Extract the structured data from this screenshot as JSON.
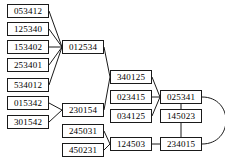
{
  "graph": {
    "type": "node-link-diagram",
    "width": 225,
    "height": 162,
    "background_color": "#ffffff",
    "node_border_color": "#1a1a1a",
    "node_fill_color": "#ffffff",
    "edge_color": "#1a1a1a",
    "nodes": [
      {
        "id": "n0",
        "label": "053412",
        "x": 7,
        "y": 4,
        "w": 42
      },
      {
        "id": "n1",
        "label": "125340",
        "x": 7,
        "y": 22,
        "w": 42
      },
      {
        "id": "n2",
        "label": "153402",
        "x": 7,
        "y": 40,
        "w": 42
      },
      {
        "id": "n3",
        "label": "253401",
        "x": 7,
        "y": 58,
        "w": 42
      },
      {
        "id": "n4",
        "label": "534012",
        "x": 7,
        "y": 78,
        "w": 42
      },
      {
        "id": "n5",
        "label": "015342",
        "x": 7,
        "y": 96,
        "w": 42
      },
      {
        "id": "n6",
        "label": "301542",
        "x": 7,
        "y": 115,
        "w": 42
      },
      {
        "id": "n7",
        "label": "012534",
        "x": 62,
        "y": 40,
        "w": 42
      },
      {
        "id": "n8",
        "label": "230154",
        "x": 62,
        "y": 103,
        "w": 42
      },
      {
        "id": "n9",
        "label": "245031",
        "x": 62,
        "y": 124,
        "w": 42
      },
      {
        "id": "n10",
        "label": "450231",
        "x": 62,
        "y": 143,
        "w": 42
      },
      {
        "id": "n11",
        "label": "340125",
        "x": 110,
        "y": 70,
        "w": 42
      },
      {
        "id": "n12",
        "label": "023415",
        "x": 110,
        "y": 90,
        "w": 42
      },
      {
        "id": "n13",
        "label": "034125",
        "x": 110,
        "y": 109,
        "w": 42
      },
      {
        "id": "n14",
        "label": "124503",
        "x": 110,
        "y": 137,
        "w": 42
      },
      {
        "id": "n15",
        "label": "025341",
        "x": 160,
        "y": 90,
        "w": 42
      },
      {
        "id": "n16",
        "label": "145023",
        "x": 160,
        "y": 109,
        "w": 42
      },
      {
        "id": "n17",
        "label": "234015",
        "x": 160,
        "y": 137,
        "w": 42
      }
    ],
    "edges": [
      {
        "from": "n0",
        "to": "n7",
        "shape": "line"
      },
      {
        "from": "n1",
        "to": "n7",
        "shape": "line"
      },
      {
        "from": "n2",
        "to": "n7",
        "shape": "line"
      },
      {
        "from": "n3",
        "to": "n7",
        "shape": "line"
      },
      {
        "from": "n4",
        "to": "n7",
        "shape": "line"
      },
      {
        "from": "n5",
        "to": "n8",
        "shape": "line"
      },
      {
        "from": "n6",
        "to": "n8",
        "shape": "line"
      },
      {
        "from": "n7",
        "to": "n11",
        "shape": "line"
      },
      {
        "from": "n8",
        "to": "n11",
        "shape": "line"
      },
      {
        "from": "n9",
        "to": "n14",
        "shape": "line"
      },
      {
        "from": "n10",
        "to": "n14",
        "shape": "line"
      },
      {
        "from": "n11",
        "to": "n15",
        "shape": "line"
      },
      {
        "from": "n12",
        "to": "n15",
        "shape": "line"
      },
      {
        "from": "n13",
        "to": "n15",
        "shape": "line"
      },
      {
        "from": "n14",
        "to": "n17",
        "shape": "line"
      },
      {
        "from": "n15",
        "to": "n16",
        "shape": "line"
      },
      {
        "from": "n16",
        "to": "n17",
        "shape": "line"
      },
      {
        "from": "n15",
        "to": "n17",
        "shape": "curve-right"
      }
    ]
  }
}
